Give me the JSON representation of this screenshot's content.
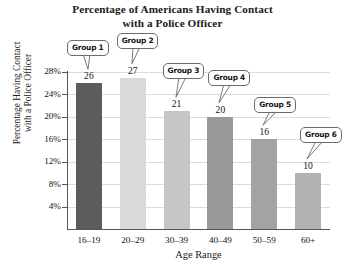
{
  "chart_data": {
    "type": "bar",
    "title": "Percentage of Americans Having Contact with a Police Officer",
    "title_lines": [
      "Percentage of Americans Having Contact",
      "with a Police Officer"
    ],
    "xlabel": "Age Range",
    "ylabel": "Percentage Having Contact with a Police Officer",
    "ylabel_lines": [
      "Percentage Having Contact",
      "with a Police Officer"
    ],
    "categories": [
      "16–19",
      "20–29",
      "30–39",
      "40–49",
      "50–59",
      "60+"
    ],
    "values": [
      26,
      27,
      21,
      20,
      16,
      10
    ],
    "value_labels": [
      "26",
      "27",
      "21",
      "20",
      "16",
      "10"
    ],
    "bar_colors": [
      "#5c5c5c",
      "#d9d9d9",
      "#c6c6c6",
      "#999999",
      "#a3a3a3",
      "#b2b2b2"
    ],
    "annotations": [
      "Group 1",
      "Group 2",
      "Group 3",
      "Group 4",
      "Group 5",
      "Group 6"
    ],
    "ylim": [
      0,
      28
    ],
    "ytick_labels": [
      "4%",
      "8%",
      "12%",
      "16%",
      "20%",
      "24%",
      "28%"
    ],
    "ytick_values": [
      4,
      8,
      12,
      16,
      20,
      24,
      28
    ],
    "grid": true,
    "legend": "none",
    "grid_color": "#dcdcdc",
    "axis_color": "#555555",
    "background": "#ffffff"
  }
}
